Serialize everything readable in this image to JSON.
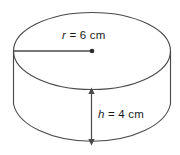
{
  "figure": {
    "name": "cylinder-diagram",
    "shape": "cylinder",
    "stroke_color": "#4a4a4a",
    "background_color": "#ffffff",
    "text_color": "#1a1a1a",
    "radius_label": {
      "variable": "r",
      "equals": "=",
      "value": "6 cm",
      "full": "r = 6 cm"
    },
    "height_label": {
      "variable": "h",
      "equals": "=",
      "value": "4 cm",
      "full": "h = 4 cm"
    },
    "annotations": {
      "radius_line": "radius-segment-from-edge-to-center",
      "center_point": "ellipse-center-dot",
      "height_arrow": "double-headed-vertical-dimension-arrow"
    }
  }
}
